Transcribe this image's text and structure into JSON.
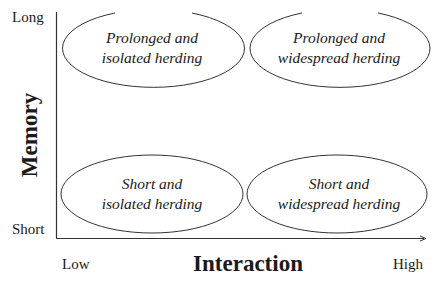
{
  "diagram": {
    "type": "2x2 quadrant matrix",
    "y_axis": {
      "title": "Memory",
      "low_label": "Short",
      "high_label": "Long"
    },
    "x_axis": {
      "title": "Interaction",
      "low_label": "Low",
      "high_label": "High"
    },
    "quadrants": [
      {
        "position": "top-left",
        "line1": "Prolonged and",
        "line2": "isolated herding"
      },
      {
        "position": "top-right",
        "line1": "Prolonged and",
        "line2": "widespread herding"
      },
      {
        "position": "bottom-left",
        "line1": "Short and",
        "line2": "isolated herding"
      },
      {
        "position": "bottom-right",
        "line1": "Short and",
        "line2": "widespread herding"
      }
    ],
    "colors": {
      "line": "#333333",
      "text": "#1a1a1a",
      "background": "#ffffff"
    }
  }
}
